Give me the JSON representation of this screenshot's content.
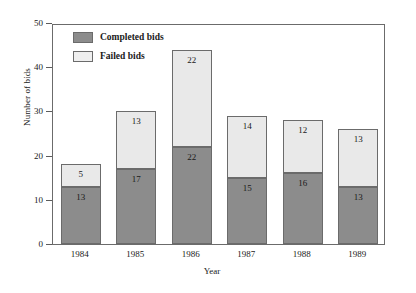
{
  "chart_data": {
    "type": "bar",
    "stacked": true,
    "title": "",
    "xlabel": "Year",
    "ylabel": "Number of bids",
    "categories": [
      "1984",
      "1985",
      "1986",
      "1987",
      "1988",
      "1989"
    ],
    "series": [
      {
        "name": "Completed bids",
        "color": "#8c8c8c",
        "values": [
          13,
          17,
          22,
          15,
          16,
          13
        ]
      },
      {
        "name": "Failed bids",
        "color": "#e9e9e9",
        "values": [
          5,
          13,
          22,
          14,
          12,
          13
        ]
      }
    ],
    "totals": [
      18,
      30,
      44,
      29,
      28,
      26
    ],
    "ylim": [
      0,
      50
    ],
    "yticks": [
      0,
      10,
      20,
      30,
      40,
      50
    ],
    "ytick_labels": [
      "0",
      "10",
      "20",
      "30",
      "40",
      "50"
    ],
    "grid": false,
    "legend_position": "top-left",
    "frame": true
  },
  "legend": {
    "items": [
      {
        "label": "Completed bids",
        "swatch": "completed"
      },
      {
        "label": "Failed bids",
        "swatch": "failed"
      }
    ]
  },
  "axes": {
    "y_title": "Number of bids",
    "x_title": "Year"
  }
}
